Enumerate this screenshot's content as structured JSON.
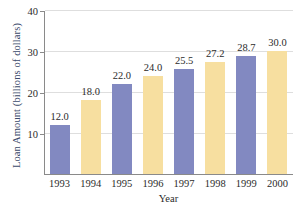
{
  "chart_data": {
    "type": "bar",
    "title": "",
    "xlabel": "Year",
    "ylabel": "Loan Amount (billions of dollars)",
    "categories": [
      "1993",
      "1994",
      "1995",
      "1996",
      "1997",
      "1998",
      "1999",
      "2000"
    ],
    "values": [
      12.0,
      18.0,
      22.0,
      24.0,
      25.5,
      27.2,
      28.7,
      30.0
    ],
    "value_labels": [
      "12.0",
      "18.0",
      "22.0",
      "24.0",
      "25.5",
      "27.2",
      "28.7",
      "30.0"
    ],
    "bar_colors": [
      "#8289c1",
      "#f7dfa0",
      "#8289c1",
      "#f7dfa0",
      "#8289c1",
      "#f7dfa0",
      "#8289c1",
      "#f7dfa0"
    ],
    "ylim": [
      0,
      40
    ],
    "yticks": [
      10,
      20,
      30,
      40
    ],
    "ytick_labels": [
      "10",
      "20",
      "30",
      "40"
    ],
    "grid": true,
    "legend": "none",
    "colors": {
      "bar_blue": "#8289c1",
      "bar_yellow": "#f7dfa0",
      "axis": "#8a8a8a",
      "grid": "#dedede",
      "ylabel_text": "#3b4a6b",
      "tick_text": "#2b2b2b",
      "background": "#ffffff"
    }
  }
}
